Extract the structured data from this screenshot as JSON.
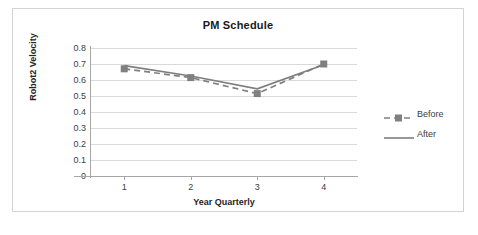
{
  "chart_data": {
    "type": "line",
    "title": "PM Schedule",
    "xlabel": "Year Quarterly",
    "ylabel": "Robot2  Velocity",
    "categories": [
      "1",
      "2",
      "3",
      "4"
    ],
    "ylim": [
      0,
      0.8
    ],
    "ytick_labels": [
      "0.8",
      "0.7",
      "0.6",
      "0.5",
      "0.4",
      "0.3",
      "0.2",
      "0.1",
      "0"
    ],
    "ytick_values": [
      0.8,
      0.7,
      0.6,
      0.5,
      0.4,
      0.3,
      0.2,
      0.1,
      0
    ],
    "grid": true,
    "legend_position": "right",
    "series": [
      {
        "name": "Before",
        "values": [
          0.67,
          0.615,
          0.515,
          0.7
        ],
        "style": "dashed",
        "marker": "square",
        "color": "#808080"
      },
      {
        "name": "After",
        "values": [
          0.69,
          0.625,
          0.545,
          0.695
        ],
        "style": "solid",
        "marker": "none",
        "color": "#7f7f7f"
      }
    ]
  },
  "colors": {
    "series_before": "#808080",
    "series_after": "#7f7f7f",
    "gridline": "#d9d9d9",
    "axis": "#a6a6a6",
    "border": "#d3d3d3",
    "text": "#404040",
    "title_text": "#1a1a1a"
  }
}
